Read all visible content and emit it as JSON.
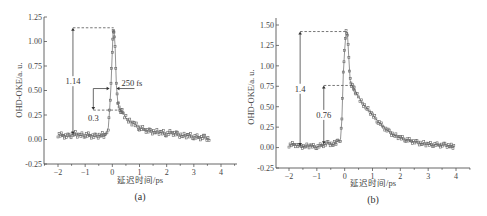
{
  "chart_data": [
    {
      "id": "a",
      "type": "line",
      "title": "",
      "subtitle": "(a)",
      "xlabel": "延迟时间/ps",
      "ylabel": "OHD-OKE/a. u.",
      "xlim": [
        -2.5,
        4.5
      ],
      "ylim": [
        -0.25,
        1.25
      ],
      "xticks": [
        -2,
        -1,
        0,
        1,
        2,
        3,
        4
      ],
      "yticks": [
        -0.25,
        0.0,
        0.25,
        0.5,
        0.75,
        1.0,
        1.25
      ],
      "ytick_labels": [
        "-0.25",
        "0.00",
        "0.25",
        "0.50",
        "0.75",
        "1.00",
        "1.25"
      ],
      "grid": false,
      "series": [
        {
          "name": "OHD-OKE signal",
          "x": [
            -2.0,
            -1.8,
            -1.6,
            -1.4,
            -1.2,
            -1.0,
            -0.8,
            -0.6,
            -0.4,
            -0.25,
            -0.15,
            -0.1,
            -0.05,
            0.0,
            0.03,
            0.06,
            0.1,
            0.15,
            0.2,
            0.25,
            0.3,
            0.4,
            0.5,
            0.6,
            0.8,
            1.0,
            1.2,
            1.4,
            1.6,
            1.8,
            2.0,
            2.2,
            2.4,
            2.6,
            2.8,
            3.0,
            3.2,
            3.4,
            3.6
          ],
          "y": [
            0.05,
            0.04,
            0.03,
            0.06,
            0.04,
            0.05,
            0.04,
            0.03,
            0.05,
            0.04,
            0.12,
            0.3,
            0.55,
            0.9,
            1.1,
            1.12,
            0.95,
            0.55,
            0.38,
            0.32,
            0.3,
            0.27,
            0.22,
            0.19,
            0.16,
            0.12,
            0.1,
            0.08,
            0.08,
            0.07,
            0.06,
            0.07,
            0.05,
            0.04,
            0.04,
            0.03,
            0.02,
            0.02,
            0.0
          ]
        }
      ],
      "annotations": [
        {
          "label": "1.14",
          "type": "vertical-double-arrow",
          "x": -1.45,
          "y_from": 0.05,
          "y_to": 1.14
        },
        {
          "label": "0.3",
          "type": "down-arrow",
          "x": -0.7,
          "y_from": 0.52,
          "y_to": 0.3
        },
        {
          "label": "250 fs",
          "type": "horizontal-arrows",
          "x_from": -0.1,
          "x_to": 0.15,
          "y": 0.52
        },
        {
          "type": "dashed-hline",
          "y": 1.14,
          "x_from": -1.45,
          "x_to": 0.05
        },
        {
          "type": "dashed-hline",
          "y": 0.3,
          "x_from": -0.7,
          "x_to": 0.3
        }
      ]
    },
    {
      "id": "b",
      "type": "line",
      "title": "",
      "subtitle": "(b)",
      "xlabel": "延迟时间/ps",
      "ylabel": "OHD-OKE/a. u.",
      "xlim": [
        -2.5,
        4.5
      ],
      "ylim": [
        -0.25,
        1.5
      ],
      "xticks": [
        -2,
        -1,
        0,
        1,
        2,
        3,
        4
      ],
      "yticks": [
        -0.25,
        0.0,
        0.25,
        0.5,
        0.75,
        1.0,
        1.25,
        1.5
      ],
      "ytick_labels": [
        "-0.25",
        "0.00",
        "0.25",
        "0.50",
        "0.75",
        "1.00",
        "1.25",
        "1.50"
      ],
      "grid": false,
      "series": [
        {
          "name": "OHD-OKE signal",
          "x": [
            -2.0,
            -1.8,
            -1.6,
            -1.4,
            -1.2,
            -1.0,
            -0.8,
            -0.6,
            -0.4,
            -0.25,
            -0.15,
            -0.1,
            -0.05,
            0.0,
            0.05,
            0.1,
            0.15,
            0.2,
            0.25,
            0.3,
            0.4,
            0.5,
            0.6,
            0.8,
            1.0,
            1.2,
            1.4,
            1.6,
            1.8,
            2.0,
            2.2,
            2.4,
            2.6,
            2.8,
            3.0,
            3.2,
            3.4,
            3.6,
            3.8,
            3.95
          ],
          "y": [
            0.03,
            0.04,
            0.01,
            0.02,
            0.02,
            0.01,
            0.03,
            0.05,
            0.04,
            0.08,
            0.1,
            0.35,
            0.9,
            1.2,
            1.42,
            1.4,
            1.1,
            0.82,
            0.76,
            0.74,
            0.68,
            0.62,
            0.56,
            0.48,
            0.4,
            0.32,
            0.25,
            0.19,
            0.15,
            0.12,
            0.1,
            0.08,
            0.06,
            0.05,
            0.04,
            0.04,
            0.03,
            0.03,
            0.02,
            0.01
          ]
        }
      ],
      "annotations": [
        {
          "label": "1.4",
          "type": "vertical-double-arrow",
          "x": -1.6,
          "y_from": 0.02,
          "y_to": 1.42
        },
        {
          "label": "0.76",
          "type": "vertical-double-arrow",
          "x": -0.75,
          "y_from": 0.04,
          "y_to": 0.76
        },
        {
          "type": "dashed-hline",
          "y": 1.42,
          "x_from": -1.6,
          "x_to": 0.05
        },
        {
          "type": "dashed-hline",
          "y": 0.76,
          "x_from": -0.75,
          "x_to": 0.25
        }
      ]
    }
  ]
}
